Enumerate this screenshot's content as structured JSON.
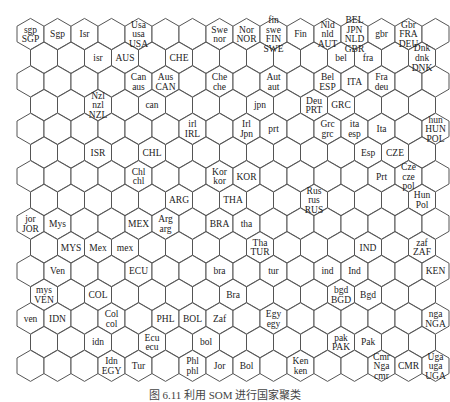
{
  "figure": {
    "type": "self-organizing-map-hex-grid",
    "caption": "图 6.11  利用 SOM 进行国家聚类",
    "grid": {
      "rows": 15,
      "even_row_cols": 16,
      "odd_row_cols": 15,
      "hex_width": 27,
      "row_pitch": 23.7,
      "x0": 30.5,
      "y0": 34,
      "stroke": "#555555",
      "fill": "#ffffff"
    },
    "cells": [
      {
        "r": 0,
        "c": 0,
        "labels": [
          "sgp",
          "SGP"
        ]
      },
      {
        "r": 0,
        "c": 1,
        "labels": [
          "Sgp"
        ]
      },
      {
        "r": 0,
        "c": 2,
        "labels": [
          "Isr"
        ]
      },
      {
        "r": 0,
        "c": 4,
        "labels": [
          "Usa",
          "usa",
          "USA"
        ]
      },
      {
        "r": 0,
        "c": 7,
        "labels": [
          "Swe",
          "nor"
        ]
      },
      {
        "r": 0,
        "c": 8,
        "labels": [
          "Nor",
          "NOR"
        ]
      },
      {
        "r": 0,
        "c": 9,
        "labels": [
          "fin",
          "swe",
          "FIN",
          "SWE"
        ]
      },
      {
        "r": 0,
        "c": 10,
        "labels": [
          "Fin"
        ]
      },
      {
        "r": 0,
        "c": 11,
        "labels": [
          "Nld",
          "nld",
          "AUT"
        ]
      },
      {
        "r": 0,
        "c": 12,
        "labels": [
          "BEL",
          "JPN",
          "NLD",
          "GBR"
        ]
      },
      {
        "r": 0,
        "c": 13,
        "labels": [
          "gbr"
        ]
      },
      {
        "r": 0,
        "c": 14,
        "labels": [
          "Gbr",
          "FRA",
          "DEU"
        ]
      },
      {
        "r": 1,
        "c": 2,
        "labels": [
          "isr"
        ]
      },
      {
        "r": 1,
        "c": 3,
        "labels": [
          "AUS"
        ]
      },
      {
        "r": 1,
        "c": 5,
        "labels": [
          "CHE"
        ]
      },
      {
        "r": 1,
        "c": 11,
        "labels": [
          "bel"
        ]
      },
      {
        "r": 1,
        "c": 12,
        "labels": [
          "fra"
        ]
      },
      {
        "r": 1,
        "c": 14,
        "labels": [
          "Dnk",
          "dnk",
          "DNK"
        ]
      },
      {
        "r": 2,
        "c": 4,
        "labels": [
          "Can",
          "aus"
        ]
      },
      {
        "r": 2,
        "c": 5,
        "labels": [
          "Aus",
          "CAN"
        ]
      },
      {
        "r": 2,
        "c": 7,
        "labels": [
          "Che",
          "che"
        ]
      },
      {
        "r": 2,
        "c": 9,
        "labels": [
          "Aut",
          "aut"
        ]
      },
      {
        "r": 2,
        "c": 11,
        "labels": [
          "Bel",
          "ESP"
        ]
      },
      {
        "r": 2,
        "c": 12,
        "labels": [
          "ITA"
        ]
      },
      {
        "r": 2,
        "c": 13,
        "labels": [
          "Fra",
          "deu"
        ]
      },
      {
        "r": 3,
        "c": 2,
        "labels": [
          "Nzl",
          "nzl",
          "NZL"
        ]
      },
      {
        "r": 3,
        "c": 4,
        "labels": [
          "can"
        ]
      },
      {
        "r": 3,
        "c": 8,
        "labels": [
          "jpn"
        ]
      },
      {
        "r": 3,
        "c": 10,
        "labels": [
          "Deu",
          "PRT"
        ]
      },
      {
        "r": 3,
        "c": 11,
        "labels": [
          "GRC"
        ]
      },
      {
        "r": 4,
        "c": 6,
        "labels": [
          "irl",
          "IRL"
        ]
      },
      {
        "r": 4,
        "c": 8,
        "labels": [
          "Irl",
          "Jpn"
        ]
      },
      {
        "r": 4,
        "c": 9,
        "labels": [
          "prt"
        ]
      },
      {
        "r": 4,
        "c": 11,
        "labels": [
          "Grc",
          "grc"
        ]
      },
      {
        "r": 4,
        "c": 12,
        "labels": [
          "ita",
          "esp"
        ]
      },
      {
        "r": 4,
        "c": 13,
        "labels": [
          "Ita"
        ]
      },
      {
        "r": 4,
        "c": 15,
        "labels": [
          "hun",
          "HUN",
          "POL"
        ]
      },
      {
        "r": 5,
        "c": 2,
        "labels": [
          "ISR"
        ]
      },
      {
        "r": 5,
        "c": 4,
        "labels": [
          "CHL"
        ]
      },
      {
        "r": 5,
        "c": 12,
        "labels": [
          "Esp"
        ]
      },
      {
        "r": 5,
        "c": 13,
        "labels": [
          "CZE"
        ]
      },
      {
        "r": 6,
        "c": 4,
        "labels": [
          "Chl",
          "chl"
        ]
      },
      {
        "r": 6,
        "c": 7,
        "labels": [
          "Kor",
          "kor"
        ]
      },
      {
        "r": 6,
        "c": 8,
        "labels": [
          "KOR"
        ]
      },
      {
        "r": 6,
        "c": 13,
        "labels": [
          "Prt"
        ]
      },
      {
        "r": 6,
        "c": 14,
        "labels": [
          "Cze",
          "cze",
          "pol"
        ]
      },
      {
        "r": 7,
        "c": 5,
        "labels": [
          "ARG"
        ]
      },
      {
        "r": 7,
        "c": 7,
        "labels": [
          "THA"
        ]
      },
      {
        "r": 7,
        "c": 10,
        "labels": [
          "Rus",
          "rus",
          "RUS"
        ]
      },
      {
        "r": 7,
        "c": 14,
        "labels": [
          "Hun",
          "Pol"
        ]
      },
      {
        "r": 8,
        "c": 0,
        "labels": [
          "jor",
          "JOR"
        ]
      },
      {
        "r": 8,
        "c": 1,
        "labels": [
          "Mys"
        ]
      },
      {
        "r": 8,
        "c": 4,
        "labels": [
          "MEX"
        ]
      },
      {
        "r": 8,
        "c": 5,
        "labels": [
          "Arg",
          "arg"
        ]
      },
      {
        "r": 8,
        "c": 7,
        "labels": [
          "BRA"
        ]
      },
      {
        "r": 8,
        "c": 8,
        "labels": [
          "tha"
        ]
      },
      {
        "r": 9,
        "c": 1,
        "labels": [
          "MYS"
        ]
      },
      {
        "r": 9,
        "c": 2,
        "labels": [
          "Mex"
        ]
      },
      {
        "r": 9,
        "c": 3,
        "labels": [
          "mex"
        ]
      },
      {
        "r": 9,
        "c": 8,
        "labels": [
          "Tha",
          "TUR"
        ]
      },
      {
        "r": 9,
        "c": 12,
        "labels": [
          "IND"
        ]
      },
      {
        "r": 9,
        "c": 14,
        "labels": [
          "zaf",
          "ZAF"
        ]
      },
      {
        "r": 10,
        "c": 1,
        "labels": [
          "Ven"
        ]
      },
      {
        "r": 10,
        "c": 4,
        "labels": [
          "ECU"
        ]
      },
      {
        "r": 10,
        "c": 7,
        "labels": [
          "bra"
        ]
      },
      {
        "r": 10,
        "c": 9,
        "labels": [
          "tur"
        ]
      },
      {
        "r": 10,
        "c": 11,
        "labels": [
          "ind"
        ]
      },
      {
        "r": 10,
        "c": 12,
        "labels": [
          "Ind"
        ]
      },
      {
        "r": 10,
        "c": 15,
        "labels": [
          "KEN"
        ]
      },
      {
        "r": 11,
        "c": 0,
        "labels": [
          "mys",
          "VEN"
        ]
      },
      {
        "r": 11,
        "c": 2,
        "labels": [
          "COL"
        ]
      },
      {
        "r": 11,
        "c": 7,
        "labels": [
          "Bra"
        ]
      },
      {
        "r": 11,
        "c": 11,
        "labels": [
          "bgd",
          "BGD"
        ]
      },
      {
        "r": 11,
        "c": 12,
        "labels": [
          "Bgd"
        ]
      },
      {
        "r": 12,
        "c": 0,
        "labels": [
          "ven"
        ]
      },
      {
        "r": 12,
        "c": 1,
        "labels": [
          "IDN"
        ]
      },
      {
        "r": 12,
        "c": 3,
        "labels": [
          "Col",
          "col"
        ]
      },
      {
        "r": 12,
        "c": 5,
        "labels": [
          "PHL"
        ]
      },
      {
        "r": 12,
        "c": 6,
        "labels": [
          "BOL"
        ]
      },
      {
        "r": 12,
        "c": 7,
        "labels": [
          "Zaf"
        ]
      },
      {
        "r": 12,
        "c": 9,
        "labels": [
          "Egy",
          "egy"
        ]
      },
      {
        "r": 12,
        "c": 15,
        "labels": [
          "nga",
          "NGA"
        ]
      },
      {
        "r": 13,
        "c": 2,
        "labels": [
          "idn"
        ]
      },
      {
        "r": 13,
        "c": 4,
        "labels": [
          "Ecu",
          "ecu"
        ]
      },
      {
        "r": 13,
        "c": 6,
        "labels": [
          "bol"
        ]
      },
      {
        "r": 13,
        "c": 11,
        "labels": [
          "pak",
          "PAK"
        ]
      },
      {
        "r": 13,
        "c": 12,
        "labels": [
          "Pak"
        ]
      },
      {
        "r": 14,
        "c": 3,
        "labels": [
          "Idn",
          "EGY"
        ]
      },
      {
        "r": 14,
        "c": 4,
        "labels": [
          "Tur"
        ]
      },
      {
        "r": 14,
        "c": 6,
        "labels": [
          "Phl",
          "phl"
        ]
      },
      {
        "r": 14,
        "c": 7,
        "labels": [
          "Jor"
        ]
      },
      {
        "r": 14,
        "c": 8,
        "labels": [
          "Bol"
        ]
      },
      {
        "r": 14,
        "c": 10,
        "labels": [
          "Ken",
          "ken"
        ]
      },
      {
        "r": 14,
        "c": 13,
        "labels": [
          "Cmr",
          "Nga",
          "cmr"
        ]
      },
      {
        "r": 14,
        "c": 14,
        "labels": [
          "CMR"
        ]
      },
      {
        "r": 14,
        "c": 15,
        "labels": [
          "Uga",
          "uga",
          "UGA"
        ]
      }
    ]
  }
}
